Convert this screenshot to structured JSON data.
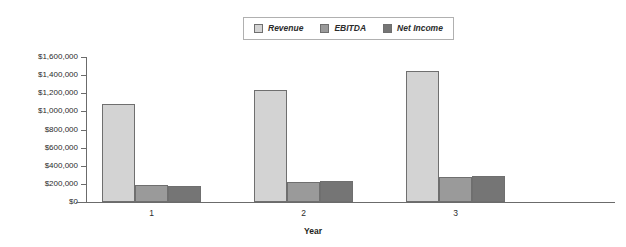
{
  "chart_data": {
    "type": "bar",
    "title": "",
    "xlabel": "Year",
    "ylabel": "",
    "categories": [
      "1",
      "2",
      "3"
    ],
    "series": [
      {
        "name": "Revenue",
        "color": "#d3d3d3",
        "values": [
          1080000,
          1240000,
          1440000
        ]
      },
      {
        "name": "EBITDA",
        "color": "#9a9a9a",
        "values": [
          190000,
          225000,
          280000
        ]
      },
      {
        "name": "Net Income",
        "color": "#757575",
        "values": [
          180000,
          230000,
          285000
        ]
      }
    ],
    "ylim": [
      0,
      1600000
    ],
    "y_ticks": [
      0,
      200000,
      400000,
      600000,
      800000,
      1000000,
      1200000,
      1400000,
      1600000
    ],
    "y_tick_labels": [
      "$0",
      "$200,000",
      "$400,000",
      "$600,000",
      "$800,000",
      "$1,000,000",
      "$1,200,000",
      "$1,400,000",
      "$1,600,000"
    ],
    "grid": false,
    "legend_position": "top-center"
  },
  "legend": {
    "items": [
      {
        "label": "Revenue",
        "color": "#d3d3d3"
      },
      {
        "label": "EBITDA",
        "color": "#9a9a9a"
      },
      {
        "label": "Net Income",
        "color": "#757575"
      }
    ]
  },
  "axes": {
    "x_title": "Year",
    "x_tick_labels": [
      "1",
      "2",
      "3"
    ],
    "y_tick_labels": [
      "$1,600,000",
      "$1,400,000",
      "$1,200,000",
      "$1,000,000",
      "$800,000",
      "$600,000",
      "$400,000",
      "$200,000",
      "$0"
    ]
  }
}
